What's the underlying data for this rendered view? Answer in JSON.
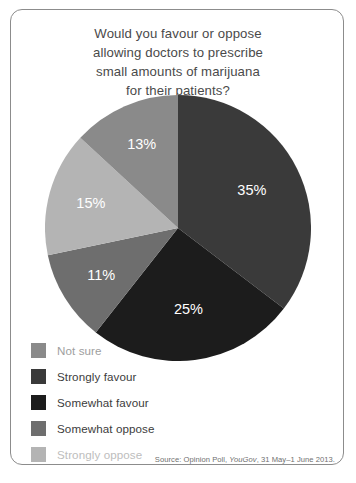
{
  "figure": {
    "title_lines": [
      "Would you favour or oppose",
      "allowing doctors to prescribe",
      "small amounts of marijuana",
      "for their patients?"
    ],
    "title_full": "Would you favour or oppose allowing doctors to prescribe small amounts of marijuana for their patients?",
    "source_prefix": "Source: Opinion Poll, ",
    "source_org": "YouGov",
    "source_suffix": ", 31 May–1 June 2013.",
    "source_full": "Source: Opinion Poll, YouGov, 31 May–1 June 2013.",
    "frame_color": "#8c8c8c",
    "background": "#ffffff"
  },
  "legend": {
    "position": "bottom-left",
    "items": [
      {
        "label": "Not sure",
        "color": "#8a8a8a",
        "text_style": "muted"
      },
      {
        "label": "Strongly favour",
        "color": "#3a3a3a",
        "text_style": "normal"
      },
      {
        "label": "Somewhat favour",
        "color": "#1c1c1c",
        "text_style": "normal"
      },
      {
        "label": "Somewhat oppose",
        "color": "#6e6e6e",
        "text_style": "normal"
      },
      {
        "label": "Strongly oppose",
        "color": "#b4b4b4",
        "text_style": "muted-light"
      }
    ]
  },
  "chart_data": {
    "type": "pie",
    "title": "Would you favour or oppose allowing doctors to prescribe small amounts of marijuana for their patients?",
    "xlabel": "",
    "ylabel": "",
    "unit": "percent",
    "start_angle_deg": 0,
    "direction": "clockwise",
    "total": 99,
    "grid": false,
    "legend_position": "bottom-left",
    "annotations": [
      "Source: Opinion Poll, YouGov, 31 May–1 June 2013."
    ],
    "categories": [
      "Strongly favour",
      "Somewhat favour",
      "Somewhat oppose",
      "Strongly oppose",
      "Not sure"
    ],
    "values": [
      35,
      25,
      11,
      15,
      13
    ],
    "labels": [
      "35%",
      "25%",
      "11%",
      "15%",
      "13%"
    ],
    "colors": [
      "#3a3a3a",
      "#1c1c1c",
      "#6e6e6e",
      "#b4b4b4",
      "#8a8a8a"
    ],
    "slices": [
      {
        "name": "Strongly favour",
        "value": 35,
        "label": "35%",
        "color": "#3a3a3a"
      },
      {
        "name": "Somewhat favour",
        "value": 25,
        "label": "25%",
        "color": "#1c1c1c"
      },
      {
        "name": "Somewhat oppose",
        "value": 11,
        "label": "11%",
        "color": "#6e6e6e"
      },
      {
        "name": "Strongly oppose",
        "value": 15,
        "label": "15%",
        "color": "#b4b4b4"
      },
      {
        "name": "Not sure",
        "value": 13,
        "label": "13%",
        "color": "#8a8a8a"
      }
    ]
  }
}
